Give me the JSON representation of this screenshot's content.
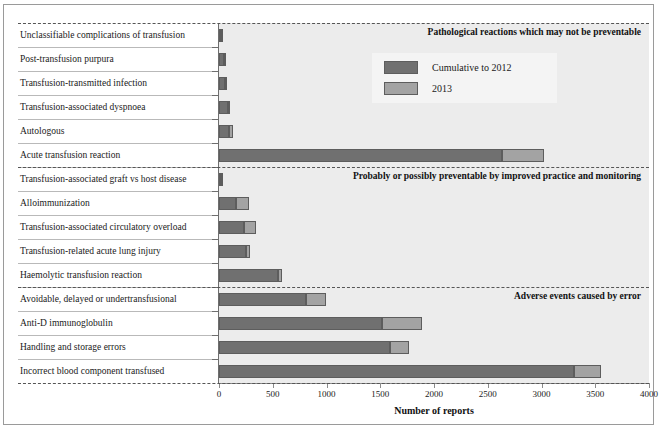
{
  "chart_data": {
    "type": "bar",
    "orientation": "horizontal",
    "stacked": true,
    "title": "",
    "xlabel": "Number of reports",
    "ylabel": "",
    "xlim": [
      0,
      4000
    ],
    "xticks": [
      0,
      500,
      1000,
      1500,
      2000,
      2500,
      3000,
      3500,
      4000
    ],
    "grid": false,
    "legend": {
      "position": "top-right",
      "entries": [
        {
          "name": "Cumulative to 2012",
          "color": "#707070"
        },
        {
          "name": "2013",
          "color": "#a3a3a3"
        }
      ]
    },
    "series": [
      {
        "name": "Cumulative to 2012",
        "color": "#707070"
      },
      {
        "name": "2013",
        "color": "#a3a3a3"
      }
    ],
    "categories": [
      "Unclassifiable complications of transfusion",
      "Post-transfusion purpura",
      "Transfusion-transmitted infection",
      "Transfusion-associated dyspnoea",
      "Autologous",
      "Acute transfusion reaction",
      "Transfusion-associated graft vs host disease",
      "Alloimmunization",
      "Transfusion-associated circulatory overload",
      "Transfusion-related acute lung injury",
      "Haemolytic transfusion reaction",
      "Avoidable, delayed or undertransfusional",
      "Anti-D immunoglobulin",
      "Handling and storage errors",
      "Incorrect blood component transfused"
    ],
    "values": {
      "Cumulative to 2012": [
        22,
        45,
        60,
        80,
        95,
        2630,
        13,
        160,
        235,
        250,
        545,
        810,
        1515,
        1590,
        3300
      ],
      "2013": [
        8,
        10,
        12,
        25,
        35,
        390,
        3,
        115,
        110,
        40,
        45,
        190,
        375,
        175,
        250
      ]
    },
    "groups": [
      {
        "label": "Pathological reactions which may not be preventable",
        "first": 0,
        "last": 5
      },
      {
        "label": "Probably or possibly preventable by improved practice and monitoring",
        "first": 6,
        "last": 10
      },
      {
        "label": "Adverse events caused by error",
        "first": 11,
        "last": 14
      }
    ]
  }
}
